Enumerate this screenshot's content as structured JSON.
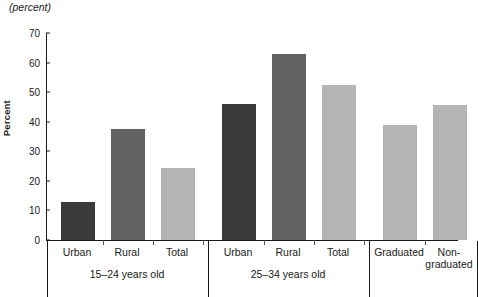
{
  "unit_note": "(percent)",
  "chart_data": {
    "type": "bar",
    "title": "",
    "subtitle": "",
    "xlabel": "",
    "ylabel": "Percent",
    "ylim": [
      0,
      70
    ],
    "yticks": [
      0,
      10,
      20,
      30,
      40,
      50,
      60,
      70
    ],
    "grid": false,
    "legend": "none",
    "categories": [
      "Urban",
      "Rural",
      "Total",
      "Urban",
      "Rural",
      "Total",
      "Graduated",
      "Non-\ngraduated"
    ],
    "values": [
      13,
      37.5,
      24.5,
      46,
      63,
      52.5,
      39,
      45.5
    ],
    "bar_colors": [
      "#3a3a3a",
      "#636363",
      "#b4b4b4",
      "#3a3a3a",
      "#636363",
      "#b4b4b4",
      "#b4b4b4",
      "#b4b4b4"
    ],
    "groups": [
      {
        "label": "15–24 years old",
        "categories": [
          "Urban",
          "Rural",
          "Total"
        ]
      },
      {
        "label": "25–34 years old",
        "categories": [
          "Urban",
          "Rural",
          "Total"
        ]
      },
      {
        "label": "",
        "categories": [
          "Graduated",
          "Non-\ngraduated"
        ]
      }
    ],
    "colors": {
      "dark": "#3a3a3a",
      "medium": "#636363",
      "light": "#b4b4b4",
      "axis": "#1a1a1a",
      "background": "#ffffff"
    }
  }
}
